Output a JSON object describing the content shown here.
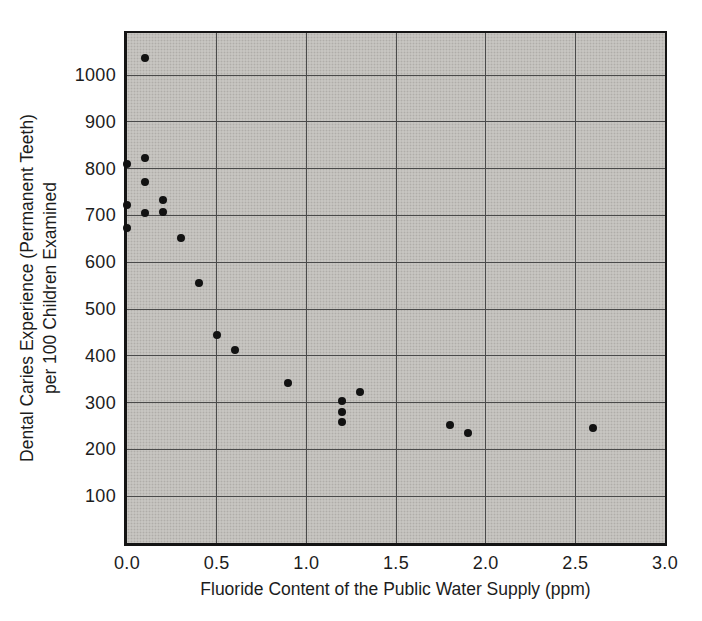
{
  "chart_data": {
    "type": "scatter",
    "xlabel": "Fluoride Content of the Public Water Supply (ppm)",
    "ylabel_line1": "Dental Caries Experience (Permanent Teeth)",
    "ylabel_line2": "per 100 Children Examined",
    "xlim": [
      0,
      3.0
    ],
    "ylim": [
      0,
      1090
    ],
    "grid": true,
    "legend": false,
    "xticks": [
      "0.0",
      "0.5",
      "1.0",
      "1.5",
      "2.0",
      "2.5",
      "3.0"
    ],
    "yticks": [
      "100",
      "200",
      "300",
      "400",
      "500",
      "600",
      "700",
      "800",
      "900",
      "1000"
    ],
    "points": [
      {
        "x": 0.1,
        "y": 1037
      },
      {
        "x": 0.1,
        "y": 823
      },
      {
        "x": 0.0,
        "y": 810
      },
      {
        "x": 0.1,
        "y": 772
      },
      {
        "x": 0.2,
        "y": 733
      },
      {
        "x": 0.0,
        "y": 722
      },
      {
        "x": 0.2,
        "y": 708
      },
      {
        "x": 0.1,
        "y": 706
      },
      {
        "x": 0.0,
        "y": 673
      },
      {
        "x": 0.3,
        "y": 652
      },
      {
        "x": 0.4,
        "y": 556
      },
      {
        "x": 0.5,
        "y": 444
      },
      {
        "x": 0.6,
        "y": 412
      },
      {
        "x": 0.9,
        "y": 343
      },
      {
        "x": 1.3,
        "y": 323
      },
      {
        "x": 1.2,
        "y": 303
      },
      {
        "x": 1.2,
        "y": 281
      },
      {
        "x": 1.2,
        "y": 258
      },
      {
        "x": 1.8,
        "y": 252
      },
      {
        "x": 1.9,
        "y": 236
      },
      {
        "x": 2.6,
        "y": 246
      }
    ],
    "colors": {
      "figure_background": "#ffffff",
      "plot_background": "#c7c5c1",
      "grid": "#4a4a4a",
      "frame": "#141414",
      "point": "#121212",
      "text": "#1c1c1c"
    }
  }
}
